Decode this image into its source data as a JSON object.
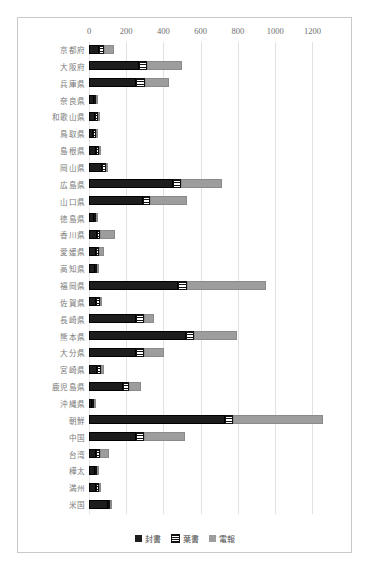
{
  "chart_data": {
    "type": "bar",
    "orientation": "horizontal",
    "stacked": true,
    "title": "",
    "xlabel": "",
    "ylabel": "",
    "xlim": [
      0,
      1300
    ],
    "xticks": [
      0,
      200,
      400,
      600,
      800,
      1000,
      1200
    ],
    "grid": true,
    "legend_position": "bottom",
    "legend": [
      "封書",
      "葉書",
      "電報"
    ],
    "colors": {
      "封書": "#1d1d1d",
      "葉書": "#111111",
      "電報": "#9d9d9d"
    },
    "categories": [
      "京都府",
      "大阪府",
      "兵庫県",
      "奈良県",
      "和歌山県",
      "鳥取県",
      "島根県",
      "岡山県",
      "広島県",
      "山口県",
      "徳島県",
      "香川県",
      "愛媛県",
      "高知県",
      "福岡県",
      "佐賀県",
      "長崎県",
      "熊本県",
      "大分県",
      "宮崎県",
      "鹿児島県",
      "沖縄県",
      "朝鮮",
      "中国",
      "台湾",
      "樺太",
      "満州",
      "米国"
    ],
    "series": [
      {
        "name": "封書",
        "values": [
          55,
          270,
          255,
          25,
          30,
          20,
          40,
          70,
          450,
          290,
          25,
          45,
          40,
          30,
          480,
          40,
          250,
          520,
          250,
          45,
          180,
          15,
          730,
          250,
          40,
          30,
          35,
          100
        ]
      },
      {
        "name": "葉書",
        "values": [
          25,
          40,
          45,
          15,
          20,
          15,
          15,
          20,
          45,
          40,
          15,
          15,
          15,
          15,
          45,
          20,
          45,
          45,
          45,
          20,
          35,
          8,
          45,
          45,
          20,
          8,
          20,
          15
        ]
      },
      {
        "name": "電報",
        "values": [
          55,
          190,
          130,
          5,
          8,
          5,
          5,
          10,
          220,
          195,
          5,
          80,
          25,
          5,
          425,
          5,
          55,
          230,
          110,
          15,
          65,
          3,
          480,
          220,
          45,
          8,
          10,
          5
        ]
      }
    ]
  }
}
